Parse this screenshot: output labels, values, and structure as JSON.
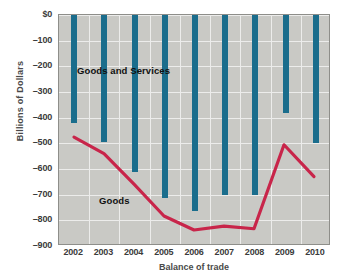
{
  "chart_data": {
    "type": "bar",
    "title": "",
    "xlabel": "Balance of trade",
    "ylabel": "Billions of Dollars",
    "categories": [
      "2002",
      "2003",
      "2004",
      "2005",
      "2006",
      "2007",
      "2008",
      "2009",
      "2010"
    ],
    "ylim": [
      -900,
      0
    ],
    "ytick_labels": [
      "$0",
      "–100",
      "–200",
      "–300",
      "–400",
      "–500",
      "–600",
      "–700",
      "–800",
      "–900"
    ],
    "ytick_values": [
      0,
      -100,
      -200,
      -300,
      -400,
      -500,
      -600,
      -700,
      -800,
      -900
    ],
    "grid": true,
    "legend_position": "inline-annotations",
    "series": [
      {
        "name": "Goods and Services",
        "render": "bar",
        "color": "#1a6d8c",
        "baseline": 0,
        "values": [
          -420,
          -495,
          -612,
          -712,
          -765,
          -702,
          -700,
          -380,
          -500
        ]
      },
      {
        "name": "Goods",
        "render": "line",
        "color": "#c8254a",
        "values": [
          -480,
          -545,
          -665,
          -790,
          -845,
          -830,
          -840,
          -510,
          -635
        ]
      }
    ],
    "annotations": [
      {
        "text": "Goods and Services",
        "series": "Goods and Services"
      },
      {
        "text": "Goods",
        "series": "Goods"
      }
    ],
    "colors": {
      "bar": "#1a6d8c",
      "line": "#c8254a",
      "plot_background": "#c9c9c5",
      "gridline": "#ececeb",
      "axis_text": "#3b3b3b",
      "page_background": "#ffffff"
    }
  }
}
